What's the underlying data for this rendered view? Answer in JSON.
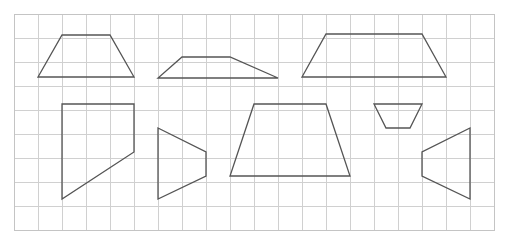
{
  "worksheet": {
    "title": "Trapezoid shapes on square grid",
    "background_color": "#ffffff"
  },
  "grid": {
    "name": "square-grid",
    "origin_x": 14,
    "origin_y": 14,
    "cell_size": 24,
    "columns": 20,
    "rows": 9,
    "width": 480,
    "height": 216,
    "line_color": "#d0d0d0",
    "border_color": "#c4c4c4",
    "line_width": 1
  },
  "shapes": {
    "stroke_color": "#555555",
    "stroke_width": 1.3,
    "fill": "none",
    "items": [
      {
        "name": "shape-trapezoid-1",
        "label": "Trapezoid 1",
        "points": "62,35 110,35 134,77 38,77",
        "vertices": [
          [
            62,
            35
          ],
          [
            110,
            35
          ],
          [
            134,
            77
          ],
          [
            38,
            77
          ]
        ]
      },
      {
        "name": "shape-trapezoid-2",
        "label": "Trapezoid 2",
        "points": "182,57 230,57 278,78 158,78",
        "vertices": [
          [
            182,
            57
          ],
          [
            230,
            57
          ],
          [
            278,
            78
          ],
          [
            158,
            78
          ]
        ]
      },
      {
        "name": "shape-trapezoid-3",
        "label": "Trapezoid 3",
        "points": "326,34 422,34 446,77 302,77",
        "vertices": [
          [
            326,
            34
          ],
          [
            422,
            34
          ],
          [
            446,
            77
          ],
          [
            302,
            77
          ]
        ]
      },
      {
        "name": "shape-quadrilateral-4",
        "label": "Quadrilateral 4",
        "points": "62,104 134,104 134,152 62,199",
        "vertices": [
          [
            62,
            104
          ],
          [
            134,
            104
          ],
          [
            134,
            152
          ],
          [
            62,
            199
          ]
        ]
      },
      {
        "name": "shape-trapezoid-5",
        "label": "Trapezoid 5",
        "points": "158,128 206,152 206,176 158,199",
        "vertices": [
          [
            158,
            128
          ],
          [
            206,
            152
          ],
          [
            206,
            176
          ],
          [
            158,
            199
          ]
        ]
      },
      {
        "name": "shape-trapezoid-6",
        "label": "Trapezoid 6",
        "points": "254,104 326,104 350,176 230,176",
        "vertices": [
          [
            254,
            104
          ],
          [
            326,
            104
          ],
          [
            350,
            176
          ],
          [
            230,
            176
          ]
        ]
      },
      {
        "name": "shape-trapezoid-7",
        "label": "Trapezoid 7",
        "points": "374,104 422,104 410,128 386,128",
        "vertices": [
          [
            374,
            104
          ],
          [
            422,
            104
          ],
          [
            410,
            128
          ],
          [
            386,
            128
          ]
        ]
      },
      {
        "name": "shape-trapezoid-8",
        "label": "Trapezoid 8",
        "points": "470,128 470,199 422,176 422,152",
        "vertices": [
          [
            470,
            128
          ],
          [
            470,
            199
          ],
          [
            422,
            176
          ],
          [
            422,
            152
          ]
        ]
      }
    ]
  }
}
